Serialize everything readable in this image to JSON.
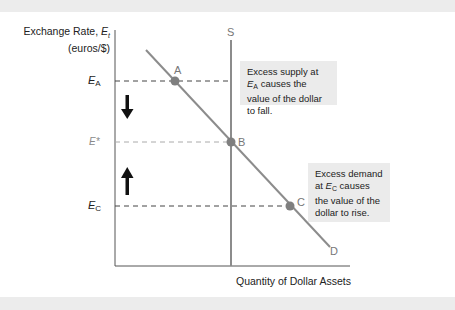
{
  "diagram": {
    "y_axis": {
      "label_line1_prefix": "Exchange Rate, ",
      "label_var": "E",
      "label_sub": "t",
      "label_line2": "(euros/$)"
    },
    "x_axis": {
      "label": "Quantity of Dollar Assets"
    },
    "levels": [
      {
        "id": "EA",
        "base": "E",
        "sub": "A",
        "role": "above-equilibrium"
      },
      {
        "id": "Estar",
        "base": "E*",
        "sub": "",
        "role": "equilibrium"
      },
      {
        "id": "EC",
        "base": "E",
        "sub": "C",
        "role": "below-equilibrium"
      }
    ],
    "curves": {
      "supply": {
        "label": "S",
        "type": "vertical"
      },
      "demand": {
        "label": "D",
        "type": "downward-sloping"
      }
    },
    "points": [
      {
        "label": "A"
      },
      {
        "label": "B"
      },
      {
        "label": "C"
      }
    ],
    "arrows": [
      {
        "direction": "down",
        "meaning": "rate falls"
      },
      {
        "direction": "up",
        "meaning": "rate rises"
      }
    ],
    "callouts": {
      "supply": {
        "text_prefix": "Excess supply at ",
        "var": "E",
        "sub": "A",
        "text_suffix": " causes the value of the dollar to fall."
      },
      "demand": {
        "text_prefix": "Excess demand at ",
        "var": "E",
        "sub": "C",
        "text_suffix": " causes the value of the dollar to rise."
      }
    },
    "colors": {
      "curve": "#8c8c8c",
      "point": "#7f7f7f",
      "axis": "#555555",
      "dash": "#444444",
      "equilibrium_dash": "#aaaaaa",
      "callout_bg": "#ebebeb",
      "arrow": "#111111"
    }
  }
}
